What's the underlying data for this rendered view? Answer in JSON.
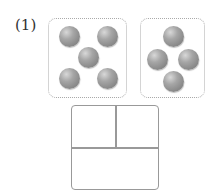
{
  "problem": {
    "label": "(1)"
  },
  "groups": [
    {
      "name": "left-group",
      "count": 5,
      "box": {
        "left": 48,
        "top": 18,
        "width": 79,
        "height": 80
      },
      "balls": [
        [
          69,
          36
        ],
        [
          107,
          36
        ],
        [
          88,
          57
        ],
        [
          69,
          78
        ],
        [
          107,
          78
        ]
      ]
    },
    {
      "name": "right-group",
      "count": 4,
      "box": {
        "left": 140,
        "top": 18,
        "width": 65,
        "height": 80
      },
      "balls": [
        [
          173,
          36
        ],
        [
          157,
          59
        ],
        [
          188,
          59
        ],
        [
          173,
          81
        ]
      ]
    }
  ],
  "answer_box": {
    "cells": [
      "",
      "",
      ""
    ]
  },
  "colors": {
    "ball": "#8a8a8a",
    "border": "#999999"
  }
}
